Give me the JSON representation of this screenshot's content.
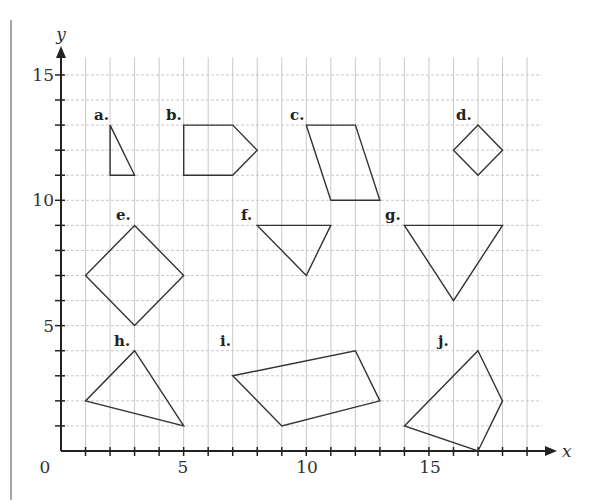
{
  "figure": {
    "title": "",
    "origin_label": "0",
    "x_axis": {
      "name": "x",
      "ticks": [
        5,
        10,
        15
      ],
      "range": [
        0,
        19
      ]
    },
    "y_axis": {
      "name": "y",
      "ticks": [
        5,
        10,
        15
      ],
      "range": [
        0,
        15
      ]
    },
    "grid": {
      "visible": true,
      "color": "#c8c8c8",
      "style": "dashed"
    }
  },
  "chart_data": {
    "type": "scatter",
    "title": "",
    "xlabel": "x",
    "ylabel": "y",
    "xlim": [
      0,
      19.6
    ],
    "ylim": [
      0,
      15.7
    ],
    "grid": true,
    "shapes": [
      {
        "label": "a.",
        "vertices": [
          [
            2,
            13
          ],
          [
            2,
            11
          ],
          [
            3,
            11
          ]
        ]
      },
      {
        "label": "b.",
        "vertices": [
          [
            5,
            13
          ],
          [
            7,
            13
          ],
          [
            8,
            12
          ],
          [
            7,
            11
          ],
          [
            5,
            11
          ]
        ]
      },
      {
        "label": "c.",
        "vertices": [
          [
            10,
            13
          ],
          [
            12,
            13
          ],
          [
            13,
            10
          ],
          [
            11,
            10
          ]
        ]
      },
      {
        "label": "d.",
        "vertices": [
          [
            17,
            13
          ],
          [
            18,
            12
          ],
          [
            17,
            11
          ],
          [
            16,
            12
          ]
        ]
      },
      {
        "label": "e.",
        "vertices": [
          [
            3,
            9
          ],
          [
            5,
            7
          ],
          [
            3,
            5
          ],
          [
            1,
            7
          ]
        ]
      },
      {
        "label": "f.",
        "vertices": [
          [
            8,
            9
          ],
          [
            11,
            9
          ],
          [
            10,
            7
          ]
        ]
      },
      {
        "label": "g.",
        "vertices": [
          [
            14,
            9
          ],
          [
            18,
            9
          ],
          [
            16,
            6
          ]
        ]
      },
      {
        "label": "h.",
        "vertices": [
          [
            3,
            4
          ],
          [
            5,
            1
          ],
          [
            1,
            2
          ]
        ]
      },
      {
        "label": "i.",
        "vertices": [
          [
            7,
            3
          ],
          [
            12,
            4
          ],
          [
            13,
            2
          ],
          [
            9,
            1
          ]
        ]
      },
      {
        "label": "j.",
        "vertices": [
          [
            17,
            4
          ],
          [
            18,
            2
          ],
          [
            17,
            0
          ],
          [
            14,
            1
          ]
        ]
      }
    ]
  },
  "labels": {
    "a": "a.",
    "b": "b.",
    "c": "c.",
    "d": "d.",
    "e": "e.",
    "f": "f.",
    "g": "g.",
    "h": "h.",
    "i": "i.",
    "j": "j.",
    "x5": "5",
    "x10": "10",
    "x15": "15",
    "y5": "5",
    "y10": "10",
    "y15": "15",
    "origin": "0",
    "xname": "x",
    "yname": "y"
  }
}
